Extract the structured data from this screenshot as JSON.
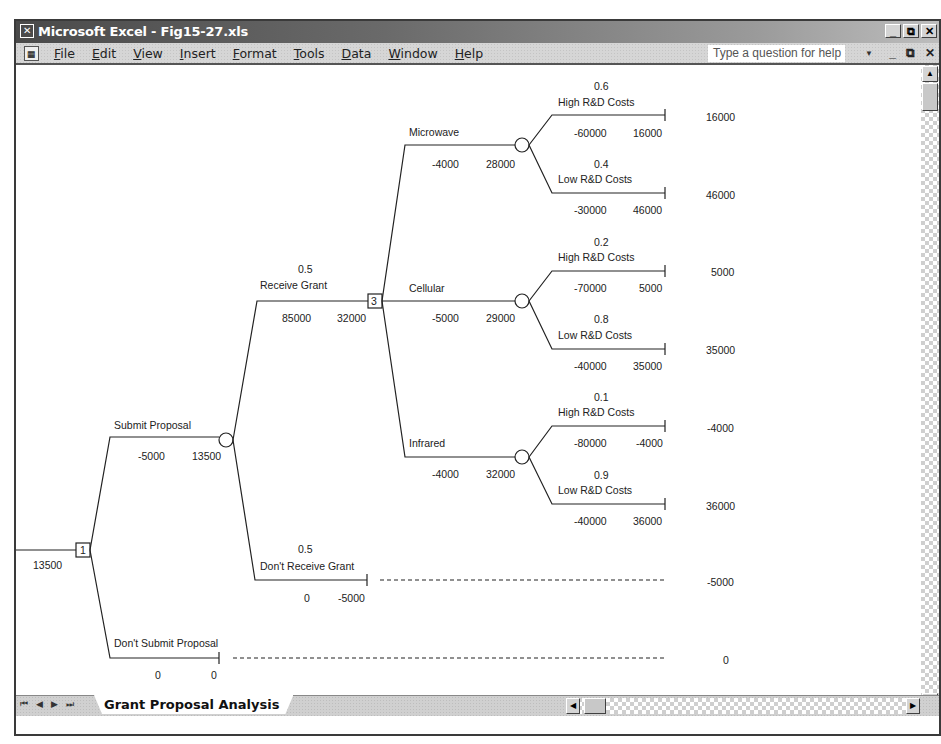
{
  "window": {
    "title": "Microsoft Excel - Fig15-27.xls",
    "controls": [
      "_",
      "⧉",
      "✕"
    ]
  },
  "menubar": {
    "items": [
      "File",
      "Edit",
      "View",
      "Insert",
      "Format",
      "Tools",
      "Data",
      "Window",
      "Help"
    ],
    "help_placeholder": "Type a question for help",
    "doc_controls": [
      "_",
      "⧉",
      "✕"
    ]
  },
  "sheet_tabs": {
    "nav": [
      "⏮",
      "◀",
      "▶",
      "⏭"
    ],
    "active": "Grant Proposal Analysis"
  },
  "tree": {
    "root_value": "13500",
    "root_node": "1",
    "submit": {
      "label": "Submit Proposal",
      "cost": "-5000",
      "value": "13500"
    },
    "dont_submit": {
      "label": "Don't Submit Proposal",
      "cost": "0",
      "value": "0",
      "payoff": "0"
    },
    "receive": {
      "prob": "0.5",
      "label": "Receive Grant",
      "cost": "85000",
      "value": "32000",
      "node": "3"
    },
    "dont_receive": {
      "prob": "0.5",
      "label": "Don't Receive Grant",
      "cost": "0",
      "value": "-5000",
      "payoff": "-5000"
    },
    "options": [
      {
        "label": "Microwave",
        "cost": "-4000",
        "value": "28000",
        "high": {
          "prob": "0.6",
          "label": "High R&D Costs",
          "cost": "-60000",
          "value": "16000",
          "payoff": "16000"
        },
        "low": {
          "prob": "0.4",
          "label": "Low R&D Costs",
          "cost": "-30000",
          "value": "46000",
          "payoff": "46000"
        }
      },
      {
        "label": "Cellular",
        "cost": "-5000",
        "value": "29000",
        "high": {
          "prob": "0.2",
          "label": "High R&D Costs",
          "cost": "-70000",
          "value": "5000",
          "payoff": "5000"
        },
        "low": {
          "prob": "0.8",
          "label": "Low R&D Costs",
          "cost": "-40000",
          "value": "35000",
          "payoff": "35000"
        }
      },
      {
        "label": "Infrared",
        "cost": "-4000",
        "value": "32000",
        "high": {
          "prob": "0.1",
          "label": "High R&D Costs",
          "cost": "-80000",
          "value": "-4000",
          "payoff": "-4000"
        },
        "low": {
          "prob": "0.9",
          "label": "Low R&D Costs",
          "cost": "-40000",
          "value": "36000",
          "payoff": "36000"
        }
      }
    ]
  }
}
